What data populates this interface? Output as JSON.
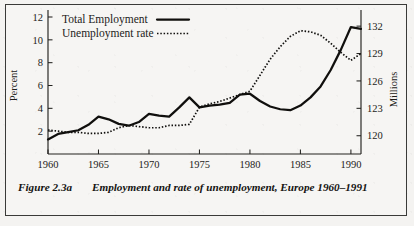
{
  "figure": {
    "label": "Figure 2.3a",
    "caption": "Employment and rate of unemployment, Europe 1960–1991"
  },
  "chart_data": {
    "type": "line",
    "title": "",
    "xlabel": "",
    "ylabel": "Percent",
    "y2label": "Millions",
    "xlim": [
      1960,
      1991
    ],
    "ylim": [
      0,
      12
    ],
    "y2lim": [
      118,
      133
    ],
    "grid": false,
    "legend_position": "top-left",
    "xticks": [
      1960,
      1965,
      1970,
      1975,
      1980,
      1985,
      1990
    ],
    "xticklabels": [
      "1960",
      "1965",
      "1970",
      "1975",
      "1980",
      "1985",
      "1990"
    ],
    "yticks": [
      2,
      4,
      6,
      8,
      10,
      12
    ],
    "yticklabels": [
      "2",
      "4",
      "6",
      "8",
      "10",
      "12"
    ],
    "y2ticks": [
      120,
      123,
      126,
      129,
      132
    ],
    "y2ticklabels": [
      "120",
      "123",
      "126",
      "129",
      "132"
    ],
    "x": [
      1960,
      1961,
      1962,
      1963,
      1964,
      1965,
      1966,
      1967,
      1968,
      1969,
      1970,
      1971,
      1972,
      1973,
      1974,
      1975,
      1976,
      1977,
      1978,
      1979,
      1980,
      1981,
      1982,
      1983,
      1984,
      1985,
      1986,
      1987,
      1988,
      1989,
      1990,
      1991
    ],
    "series": [
      {
        "name": "Total Employment",
        "axis": "right",
        "units": "Millions",
        "style": "solid",
        "values": [
          119.6,
          120.2,
          120.4,
          120.6,
          121.2,
          122.1,
          121.8,
          121.3,
          121.1,
          121.5,
          122.4,
          122.2,
          122.1,
          123.1,
          124.2,
          123.1,
          123.3,
          123.4,
          123.6,
          124.5,
          124.6,
          123.8,
          123.2,
          122.9,
          122.8,
          123.3,
          124.2,
          125.4,
          127.2,
          129.4,
          131.9,
          131.7
        ]
      },
      {
        "name": "Unemployment rate",
        "axis": "left",
        "units": "Percent",
        "style": "dotted",
        "values": [
          2.1,
          2.0,
          1.9,
          1.9,
          1.8,
          1.8,
          1.9,
          2.3,
          2.5,
          2.4,
          2.3,
          2.3,
          2.5,
          2.5,
          2.6,
          4.1,
          4.4,
          4.6,
          4.9,
          5.2,
          5.5,
          6.9,
          8.3,
          9.4,
          10.3,
          10.8,
          10.7,
          10.4,
          9.7,
          8.9,
          8.2,
          8.8
        ]
      }
    ],
    "legend": [
      {
        "label": "Total Employment",
        "style": "solid"
      },
      {
        "label": "Unemployment rate",
        "style": "dotted"
      }
    ]
  }
}
